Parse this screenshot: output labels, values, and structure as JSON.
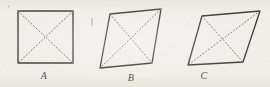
{
  "figure": {
    "caption_type": "geometry-textbook-figure",
    "background_color": "#f3f1ec",
    "stroke_color": "#3a3833",
    "dash_color": "#6e6b64",
    "label_color": "#55534e",
    "canvas": {
      "width": 270,
      "height": 87
    },
    "shapes": [
      {
        "id": "A",
        "label": "A",
        "name": "square",
        "outline_points": "18,11 73,11 73,63 18,63",
        "diagonals": [
          {
            "name": "diagonal-tl-br",
            "x1": 18,
            "y1": 11,
            "x2": 73,
            "y2": 63
          },
          {
            "name": "diagonal-tr-bl",
            "x1": 73,
            "y1": 11,
            "x2": 18,
            "y2": 63
          }
        ],
        "label_position": {
          "x": 44,
          "y": 75
        }
      },
      {
        "id": "B",
        "label": "B",
        "name": "rhombus-upright",
        "outline_points": "110,14 161,9 152,63 100,68",
        "diagonals": [
          {
            "name": "diagonal-tl-br",
            "x1": 110,
            "y1": 14,
            "x2": 152,
            "y2": 63
          },
          {
            "name": "diagonal-tr-bl",
            "x1": 161,
            "y1": 9,
            "x2": 100,
            "y2": 68
          }
        ],
        "label_position": {
          "x": 131,
          "y": 77
        }
      },
      {
        "id": "C",
        "label": "C",
        "name": "rhombus-flat",
        "outline_points": "202,16 260,11 243,62 188,65",
        "diagonals": [
          {
            "name": "diagonal-tl-br",
            "x1": 202,
            "y1": 16,
            "x2": 243,
            "y2": 62
          },
          {
            "name": "diagonal-tr-bl",
            "x1": 260,
            "y1": 11,
            "x2": 188,
            "y2": 65
          }
        ],
        "label_position": {
          "x": 204,
          "y": 75
        }
      }
    ],
    "marks": [
      {
        "name": "stray-tick-mark",
        "x1": 92,
        "y1": 18,
        "x2": 92,
        "y2": 26
      },
      {
        "name": "stray-speckle",
        "x1": 8,
        "y1": 6,
        "x2": 9,
        "y2": 7
      }
    ]
  }
}
